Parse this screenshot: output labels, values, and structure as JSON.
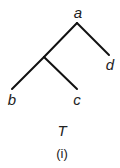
{
  "diagram": {
    "type": "tree",
    "name": "T",
    "caption": "(i)",
    "nodes": [
      {
        "id": "a",
        "label": "a",
        "x": 77,
        "y": 23
      },
      {
        "id": "n1",
        "label": "",
        "x": 44,
        "y": 57
      },
      {
        "id": "b",
        "label": "b",
        "x": 12,
        "y": 89
      },
      {
        "id": "c",
        "label": "c",
        "x": 77,
        "y": 89
      },
      {
        "id": "d",
        "label": "d",
        "x": 109,
        "y": 55
      }
    ],
    "edges": [
      [
        "a",
        "n1"
      ],
      [
        "n1",
        "b"
      ],
      [
        "n1",
        "c"
      ],
      [
        "a",
        "d"
      ]
    ],
    "line_color": "#111111"
  }
}
